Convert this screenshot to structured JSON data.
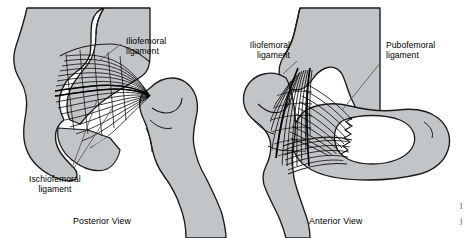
{
  "figure": {
    "background_color": "#ffffff",
    "bone_fill_color": "#c2c5c7",
    "outline_color": "#1a1a1a",
    "fiber_color": "#000000",
    "leader_color": "#555555"
  },
  "panels": [
    {
      "id": "posterior",
      "caption": "Posterior View",
      "labels": [
        {
          "id": "iliofemoral",
          "line1": "Iliofemoral",
          "line2": "ligament",
          "align": "left"
        },
        {
          "id": "ischiofemoral",
          "line1": "Ischiofemoral",
          "line2": "ligament",
          "align": "center"
        }
      ]
    },
    {
      "id": "anterior",
      "caption": "Anterior View",
      "labels": [
        {
          "id": "iliofemoral",
          "line1": "Iliofemoral",
          "line2": "ligament",
          "align": "right"
        },
        {
          "id": "pubofemoral",
          "line1": "Pubofemoral",
          "line2": "ligament",
          "align": "left"
        }
      ]
    }
  ],
  "corner_marks": {
    "line1": "l",
    "line2": "j"
  }
}
